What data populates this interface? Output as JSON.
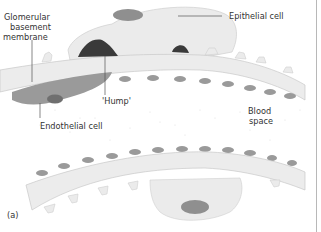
{
  "figure": {
    "panel_label": "(a)",
    "labels": {
      "gbm_line1": "Glomerular",
      "gbm_line2": "basement",
      "gbm_line3": "membrane",
      "epithelial_cell": "Epithelial cell",
      "hump": "'Hump'",
      "endothelial_cell": "Endothelial cell",
      "blood_line1": "Blood",
      "blood_line2": "space"
    },
    "colors": {
      "background": "#ffffff",
      "membrane": "#ececec",
      "membrane_edge": "#c8c8c8",
      "cell_body": "#ebebeb",
      "nucleus": "#8f8f8f",
      "hump": "#3a3a3a",
      "endothelium": "#9a9a9a",
      "blood_speckle": "#d9d9d9",
      "leader_line": "#555555"
    }
  }
}
